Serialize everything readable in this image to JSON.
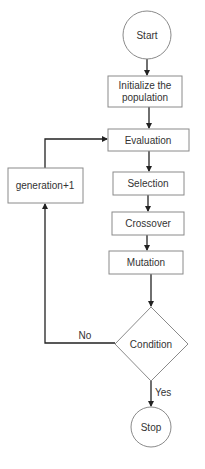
{
  "diagram": {
    "type": "flowchart",
    "colors": {
      "shape_stroke": "#8a8a8a",
      "edge": "#222222",
      "text": "#333333",
      "background": "#ffffff"
    },
    "nodes": {
      "start": {
        "shape": "circle",
        "label": "Start"
      },
      "init": {
        "shape": "rect",
        "label_line1": "Initialize the",
        "label_line2": "population"
      },
      "evaluation": {
        "shape": "rect",
        "label": "Evaluation"
      },
      "selection": {
        "shape": "rect",
        "label": "Selection"
      },
      "crossover": {
        "shape": "rect",
        "label": "Crossover"
      },
      "mutation": {
        "shape": "rect",
        "label": "Mutation"
      },
      "condition": {
        "shape": "diamond",
        "label": "Condition"
      },
      "generation": {
        "shape": "rect",
        "label": "generation+1"
      },
      "stop": {
        "shape": "circle",
        "label": "Stop"
      }
    },
    "edges": [
      {
        "from": "start",
        "to": "init",
        "label": ""
      },
      {
        "from": "init",
        "to": "evaluation",
        "label": ""
      },
      {
        "from": "evaluation",
        "to": "selection",
        "label": ""
      },
      {
        "from": "selection",
        "to": "crossover",
        "label": ""
      },
      {
        "from": "crossover",
        "to": "mutation",
        "label": ""
      },
      {
        "from": "mutation",
        "to": "condition",
        "label": ""
      },
      {
        "from": "condition",
        "to": "stop",
        "label": "Yes"
      },
      {
        "from": "condition",
        "to": "generation",
        "label": "No"
      },
      {
        "from": "generation",
        "to": "evaluation",
        "label": ""
      }
    ],
    "edge_labels": {
      "yes": "Yes",
      "no": "No"
    }
  }
}
